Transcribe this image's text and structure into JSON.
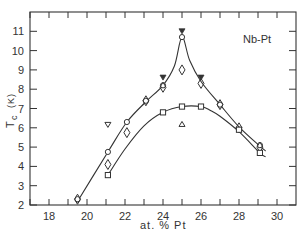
{
  "chart_data": {
    "type": "scatter",
    "title": "",
    "annotation": "Nb-Pt",
    "xlabel": "at. % Pt",
    "ylabel": "Tc (K)",
    "ylabel_main": "T",
    "ylabel_sub": "c",
    "ylabel_unit": "(K)",
    "xlim": [
      17,
      31
    ],
    "ylim": [
      2,
      12
    ],
    "xticks": [
      18,
      20,
      22,
      24,
      26,
      28,
      30
    ],
    "xticks_minor": [
      17,
      18,
      19,
      20,
      21,
      22,
      23,
      24,
      25,
      26,
      27,
      28,
      29,
      30
    ],
    "yticks": [
      2,
      3,
      4,
      5,
      6,
      7,
      8,
      9,
      10,
      11
    ],
    "grid": false,
    "legend": "none",
    "series": [
      {
        "name": "circles",
        "marker": "circle",
        "points": [
          [
            19.5,
            2.3
          ],
          [
            21.1,
            4.75
          ],
          [
            22.1,
            6.3
          ],
          [
            23.1,
            7.4
          ],
          [
            24.0,
            8.2
          ],
          [
            25.0,
            10.7
          ],
          [
            27.0,
            7.2
          ],
          [
            29.1,
            5.1
          ]
        ]
      },
      {
        "name": "diamonds",
        "marker": "diamond",
        "points": [
          [
            19.5,
            2.3
          ],
          [
            21.1,
            4.1
          ],
          [
            22.1,
            5.75
          ],
          [
            23.1,
            7.4
          ],
          [
            24.0,
            8.1
          ],
          [
            25.0,
            9.0
          ],
          [
            26.0,
            8.3
          ],
          [
            27.0,
            7.2
          ],
          [
            28.0,
            6.0
          ],
          [
            29.1,
            5.0
          ]
        ]
      },
      {
        "name": "squares",
        "marker": "square",
        "points": [
          [
            21.1,
            3.55
          ],
          [
            24.0,
            6.8
          ],
          [
            25.0,
            7.1
          ],
          [
            26.0,
            7.1
          ],
          [
            28.0,
            5.9
          ],
          [
            29.1,
            4.7
          ]
        ]
      },
      {
        "name": "filled-down-triangles",
        "marker": "triangle-down-filled",
        "points": [
          [
            24.0,
            8.6
          ],
          [
            25.0,
            11.0
          ],
          [
            26.0,
            8.6
          ]
        ]
      },
      {
        "name": "open-down-triangle",
        "marker": "triangle-down-open",
        "points": [
          [
            21.1,
            6.15
          ]
        ]
      },
      {
        "name": "open-up-triangle",
        "marker": "triangle-up-open",
        "points": [
          [
            25.0,
            6.2
          ]
        ]
      }
    ],
    "curves": [
      {
        "name": "upper-curve",
        "points": [
          [
            19.45,
            2.1
          ],
          [
            21.1,
            4.75
          ],
          [
            22.1,
            6.3
          ],
          [
            23.1,
            7.35
          ],
          [
            24.0,
            8.2
          ],
          [
            24.6,
            9.2
          ],
          [
            25.0,
            10.7
          ],
          [
            25.4,
            9.5
          ],
          [
            26.0,
            8.4
          ],
          [
            27.0,
            7.2
          ],
          [
            28.0,
            6.05
          ],
          [
            29.1,
            5.05
          ],
          [
            29.4,
            4.8
          ]
        ]
      },
      {
        "name": "lower-curve",
        "points": [
          [
            21.1,
            3.55
          ],
          [
            22.0,
            4.9
          ],
          [
            23.0,
            6.1
          ],
          [
            24.0,
            6.8
          ],
          [
            25.0,
            7.1
          ],
          [
            26.0,
            7.1
          ],
          [
            26.5,
            6.9
          ],
          [
            27.0,
            6.6
          ],
          [
            28.0,
            5.8
          ],
          [
            29.1,
            4.7
          ],
          [
            29.4,
            4.5
          ]
        ]
      }
    ]
  },
  "colors": {
    "ink": "#333333",
    "background": "#ffffff"
  }
}
